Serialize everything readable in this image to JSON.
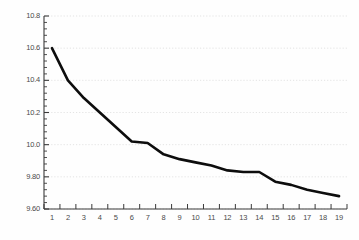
{
  "chart_data": {
    "type": "line",
    "title": "",
    "subtitle": "",
    "xlabel": "",
    "ylabel": "",
    "x": [
      1,
      2,
      3,
      4,
      5,
      6,
      7,
      8,
      9,
      10,
      11,
      12,
      13,
      14,
      15,
      16,
      17,
      18,
      19
    ],
    "values": [
      10.6,
      10.4,
      10.29,
      10.2,
      10.11,
      10.02,
      10.01,
      9.94,
      9.91,
      9.89,
      9.87,
      9.84,
      9.83,
      9.83,
      9.77,
      9.75,
      9.72,
      9.7,
      9.68
    ],
    "series": [
      {
        "name": "",
        "values": [
          10.6,
          10.4,
          10.29,
          10.2,
          10.11,
          10.02,
          10.01,
          9.94,
          9.91,
          9.89,
          9.87,
          9.84,
          9.83,
          9.83,
          9.77,
          9.75,
          9.72,
          9.7,
          9.68
        ]
      }
    ],
    "xlim": [
      0.5,
      19.5
    ],
    "ylim": [
      9.6,
      10.8
    ],
    "y_ticks": [
      10.8,
      10.6,
      10.4,
      10.2,
      10.0,
      9.8,
      9.6
    ],
    "y_tick_labels": [
      "10.8",
      "10.6",
      "10.4",
      "10.2",
      "10.0",
      "9.80",
      "9.60"
    ],
    "y_minor_ticks_per_interval": 4,
    "x_ticks": [
      1,
      2,
      3,
      4,
      5,
      6,
      7,
      8,
      9,
      10,
      11,
      12,
      13,
      14,
      15,
      16,
      17,
      18,
      19
    ],
    "x_tick_labels": [
      "1",
      "2",
      "3",
      "4",
      "5",
      "6",
      "7",
      "8",
      "9",
      "10",
      "11",
      "12",
      "13",
      "14",
      "15",
      "16",
      "17",
      "18",
      "19"
    ],
    "grid": {
      "horizontal": true,
      "vertical": false,
      "style": "dotted"
    },
    "legend": {
      "visible": false,
      "position": "none",
      "entries": []
    },
    "annotations": [],
    "colors": {
      "background": "#fefefe",
      "line": "#0d0d0d",
      "axis": "#3a3a3a",
      "grid": "#d8d8d8",
      "tick_label": "#4a4a4a"
    },
    "line_width": 2.6
  }
}
